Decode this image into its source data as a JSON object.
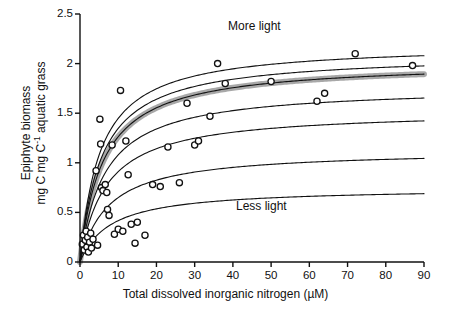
{
  "chart_data": {
    "type": "scatter",
    "title": "",
    "xlabel": "Total dissolved inorganic nitrogen (µM)",
    "ylabel": "Epiphyte biomass mg C mg C⁻¹ aquatic grass",
    "ylabel_line1": "Epiphyte biomass",
    "ylabel_line2_pre": "mg C mg C",
    "ylabel_line2_exp": "-1",
    "ylabel_line2_post": " aquatic grass",
    "xlim": [
      0,
      90
    ],
    "ylim": [
      0,
      2.5
    ],
    "xticks": [
      0,
      10,
      20,
      30,
      40,
      50,
      60,
      70,
      80,
      90
    ],
    "xtick_labels": [
      "0",
      "10",
      "20",
      "30",
      "40",
      "50",
      "60",
      "70",
      "80",
      "90"
    ],
    "yticks": [
      0,
      0.5,
      1,
      1.5,
      2,
      2.5
    ],
    "ytick_labels": [
      "0",
      "0.5",
      "1",
      "1.5",
      "2",
      "2.5"
    ],
    "grid": false,
    "legend_position": "none",
    "annotations": [
      {
        "text": "More light",
        "x": 41,
        "y": 2.32
      },
      {
        "text": "Less light",
        "x": 43,
        "y": 0.5
      }
    ],
    "series": [
      {
        "name": "observed epiphyte biomass",
        "type": "scatter",
        "marker": "open-circle",
        "marker_color": "#111111",
        "points": [
          [
            0.6,
            0.18
          ],
          [
            0.9,
            0.27
          ],
          [
            1.1,
            0.12
          ],
          [
            1.4,
            0.22
          ],
          [
            1.6,
            0.31
          ],
          [
            1.8,
            0.15
          ],
          [
            2.0,
            0.25
          ],
          [
            2.2,
            0.1
          ],
          [
            2.5,
            0.2
          ],
          [
            2.8,
            0.29
          ],
          [
            3.0,
            0.14
          ],
          [
            3.4,
            0.23
          ],
          [
            4.2,
            0.92
          ],
          [
            4.6,
            0.17
          ],
          [
            5.6,
            0.75
          ],
          [
            6.0,
            0.72
          ],
          [
            6.6,
            0.78
          ],
          [
            7.0,
            0.7
          ],
          [
            5.2,
            1.44
          ],
          [
            5.4,
            1.19
          ],
          [
            7.2,
            0.53
          ],
          [
            7.6,
            0.47
          ],
          [
            8.4,
            1.18
          ],
          [
            9.0,
            0.28
          ],
          [
            10.0,
            0.33
          ],
          [
            10.6,
            1.73
          ],
          [
            11.2,
            0.31
          ],
          [
            12.0,
            1.22
          ],
          [
            12.6,
            0.88
          ],
          [
            13.4,
            0.38
          ],
          [
            14.4,
            0.19
          ],
          [
            15.0,
            0.4
          ],
          [
            17.0,
            0.27
          ],
          [
            19.0,
            0.78
          ],
          [
            21.0,
            0.76
          ],
          [
            23.0,
            1.16
          ],
          [
            26.0,
            0.8
          ],
          [
            28.0,
            1.6
          ],
          [
            30.0,
            1.18
          ],
          [
            31.0,
            1.22
          ],
          [
            34.0,
            1.47
          ],
          [
            36.0,
            2.0
          ],
          [
            38.0,
            1.8
          ],
          [
            50.0,
            1.82
          ],
          [
            62.0,
            1.62
          ],
          [
            64.0,
            1.7
          ],
          [
            72.0,
            2.1
          ],
          [
            87.0,
            1.98
          ]
        ]
      },
      {
        "name": "light level 1 (most light)",
        "type": "curve",
        "saturation": 2.2,
        "half_sat": 5.2
      },
      {
        "name": "light level 2",
        "type": "curve",
        "saturation": 2.1,
        "half_sat": 5.6
      },
      {
        "name": "light level 3 (shaded band / mean fit)",
        "type": "curve",
        "saturation": 2.02,
        "half_sat": 6.0,
        "band": true,
        "band_color": "#999999"
      },
      {
        "name": "light level 4",
        "type": "curve",
        "saturation": 1.77,
        "half_sat": 6.4
      },
      {
        "name": "light level 5",
        "type": "curve",
        "saturation": 1.53,
        "half_sat": 6.8
      },
      {
        "name": "light level 6",
        "type": "curve",
        "saturation": 1.13,
        "half_sat": 7.4
      },
      {
        "name": "light level 7 (least light)",
        "type": "curve",
        "saturation": 0.75,
        "half_sat": 8.0
      }
    ]
  }
}
